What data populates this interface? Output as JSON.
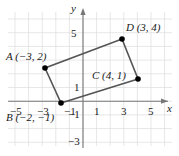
{
  "figure": {
    "type": "coordinate-plane-rectangle",
    "axes": {
      "x_axis_label": "x",
      "y_axis_label": "y",
      "x_ticks": [
        "−5",
        "−3",
        "−1",
        "1",
        "3",
        "5"
      ],
      "x_tick_values": [
        -5,
        -3,
        -1,
        1,
        3,
        5
      ],
      "y_ticks": [
        "5",
        "1",
        "−1",
        "−3"
      ],
      "y_tick_values": [
        5,
        1,
        -1,
        -3
      ],
      "grid": true,
      "xlim": [
        -6,
        6
      ],
      "ylim": [
        -4,
        6
      ]
    },
    "points": [
      {
        "id": "A",
        "label": "A (−3, 2)",
        "x": -3,
        "y": 2
      },
      {
        "id": "B",
        "label": "B (−2, −1)",
        "x": -2,
        "y": -1
      },
      {
        "id": "C",
        "label": "C (4, 1)",
        "x": 4,
        "y": 1
      },
      {
        "id": "D",
        "label": "D (3, 4)",
        "x": 3,
        "y": 4
      }
    ],
    "shape": {
      "name": "rectangle-ABCD",
      "vertex_order": [
        "A",
        "B",
        "C",
        "D"
      ]
    },
    "colors": {
      "grid": "#dcdcdc",
      "axis": "#808080",
      "shape_stroke": "#555555",
      "point_fill": "#000000",
      "text": "#1a1a1a",
      "background": "#ffffff"
    }
  }
}
